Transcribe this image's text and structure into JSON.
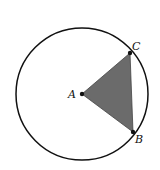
{
  "diagram": {
    "circle": {
      "cx": 82,
      "cy": 94,
      "r": 66,
      "stroke": "#111111"
    },
    "points": {
      "A": {
        "label": "A",
        "x": 82,
        "y": 94
      },
      "B": {
        "label": "B",
        "x": 133,
        "y": 132
      },
      "C": {
        "label": "C",
        "x": 130,
        "y": 53
      }
    },
    "shaded_triangle": {
      "vertices": [
        "A",
        "B",
        "C"
      ],
      "fill": "#6b6b6b"
    }
  }
}
